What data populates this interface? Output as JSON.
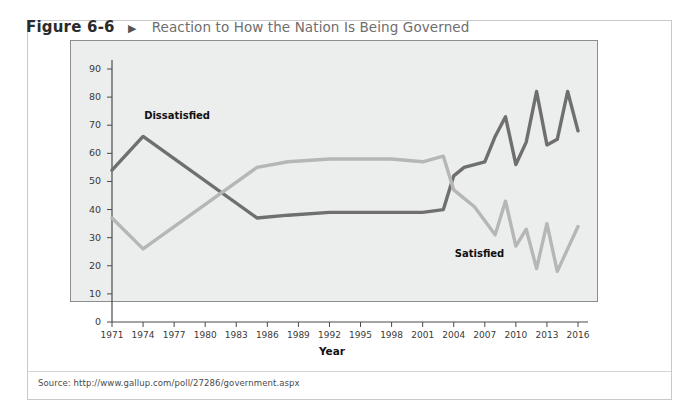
{
  "figure": {
    "number": "Figure 6-6",
    "arrow": "▶",
    "title": "Reaction to How the Nation Is Being Governed",
    "source": "Source: http://www.gallup.com/poll/27286/government.aspx"
  },
  "colors": {
    "dissatisfied": "#6f6f6f",
    "satisfied": "#b6b6b6",
    "plot_background": "#eceded",
    "plot_border": "#8d8d8d",
    "page_background": "#ffffff",
    "figure_border": "#c9c9c9",
    "caption_title": "#6e6e6e"
  },
  "chart_data": {
    "type": "line",
    "title": "Reaction to How the Nation Is Being Governed",
    "xlabel": "Year",
    "ylabel": "Percentage",
    "xlim": [
      1971,
      2016
    ],
    "ylim": [
      0,
      90
    ],
    "ytick_step": 10,
    "yticks": [
      0,
      10,
      20,
      30,
      40,
      50,
      60,
      70,
      80,
      90
    ],
    "xticks": [
      1971,
      1974,
      1977,
      1980,
      1983,
      1986,
      1989,
      1992,
      1995,
      1998,
      2001,
      2004,
      2007,
      2010,
      2013,
      2016
    ],
    "grid": false,
    "legend": "inline-annotations",
    "annotations": [
      {
        "text": "Dissatisfied",
        "x": 1977,
        "y": 73
      },
      {
        "text": "Satisfied",
        "x": 2007,
        "y": 24
      }
    ],
    "series": [
      {
        "name": "Dissatisfied",
        "color": "#6f6f6f",
        "x": [
          1971,
          1974,
          1985,
          1988,
          1992,
          1998,
          2001,
          2003,
          2004,
          2005,
          2006,
          2007,
          2008,
          2009,
          2010,
          2011,
          2012,
          2013,
          2014,
          2015,
          2016
        ],
        "values": [
          54,
          66,
          37,
          38,
          39,
          39,
          39,
          40,
          52,
          55,
          56,
          57,
          66,
          73,
          56,
          64,
          82,
          63,
          65,
          82,
          68
        ]
      },
      {
        "name": "Satisfied",
        "color": "#b6b6b6",
        "x": [
          1971,
          1974,
          1985,
          1988,
          1992,
          1998,
          2001,
          2003,
          2004,
          2005,
          2006,
          2007,
          2008,
          2009,
          2010,
          2011,
          2012,
          2013,
          2014,
          2015,
          2016
        ],
        "values": [
          37,
          26,
          55,
          57,
          58,
          58,
          57,
          59,
          47,
          44,
          41,
          36,
          31,
          43,
          27,
          33,
          19,
          35,
          18,
          26,
          34
        ]
      }
    ]
  },
  "axis": {
    "y_tick_labels": [
      "90",
      "80",
      "70",
      "60",
      "50",
      "40",
      "30",
      "20",
      "10",
      "0"
    ],
    "x_tick_labels": [
      "1971",
      "1974",
      "1977",
      "1980",
      "1983",
      "1986",
      "1989",
      "1992",
      "1995",
      "1998",
      "2001",
      "2004",
      "2007",
      "2010",
      "2013",
      "2016"
    ],
    "y_title": "Percentage",
    "x_title": "Year"
  }
}
